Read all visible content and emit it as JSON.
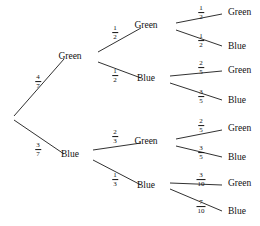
{
  "diagram": {
    "type": "probability-tree",
    "colors": {
      "stroke": "#1a1a1a",
      "text": "#111111",
      "background": "#ffffff"
    },
    "root": {
      "x": 12,
      "y": 118
    },
    "levels": [
      {
        "level": 1,
        "nodes": [
          {
            "id": "g",
            "label": "Green",
            "x": 70,
            "y": 57,
            "branch_label": "4/7",
            "branch_num": "4",
            "branch_den": "7",
            "frac_x": 38,
            "frac_y": 82
          },
          {
            "id": "b",
            "label": "Blue",
            "x": 70,
            "y": 155,
            "branch_label": "3/7",
            "branch_num": "3",
            "branch_den": "7",
            "frac_x": 38,
            "frac_y": 150
          }
        ]
      },
      {
        "level": 2,
        "nodes": [
          {
            "id": "gg",
            "parent": "g",
            "label": "Green",
            "x": 146,
            "y": 26,
            "branch_num": "1",
            "branch_den": "2",
            "frac_x": 115,
            "frac_y": 33
          },
          {
            "id": "gb",
            "parent": "g",
            "label": "Blue",
            "x": 146,
            "y": 79,
            "branch_num": "1",
            "branch_den": "2",
            "frac_x": 115,
            "frac_y": 76
          },
          {
            "id": "bg",
            "parent": "b",
            "label": "Green",
            "x": 146,
            "y": 142,
            "branch_num": "2",
            "branch_den": "3",
            "frac_x": 115,
            "frac_y": 137
          },
          {
            "id": "bb",
            "parent": "b",
            "label": "Blue",
            "x": 146,
            "y": 186,
            "branch_num": "1",
            "branch_den": "3",
            "frac_x": 115,
            "frac_y": 180
          }
        ]
      },
      {
        "level": 3,
        "nodes": [
          {
            "id": "ggg",
            "parent": "gg",
            "label": "Green",
            "x": 228,
            "y": 13,
            "branch_num": "1",
            "branch_den": "2",
            "frac_x": 201,
            "frac_y": 13
          },
          {
            "id": "ggb",
            "parent": "gg",
            "label": "Blue",
            "x": 228,
            "y": 47,
            "branch_num": "1",
            "branch_den": "2",
            "frac_x": 201,
            "frac_y": 41
          },
          {
            "id": "gbg",
            "parent": "gb",
            "label": "Green",
            "x": 228,
            "y": 71,
            "branch_num": "2",
            "branch_den": "5",
            "frac_x": 201,
            "frac_y": 68
          },
          {
            "id": "gbb",
            "parent": "gb",
            "label": "Blue",
            "x": 228,
            "y": 101,
            "branch_num": "3",
            "branch_den": "5",
            "frac_x": 201,
            "frac_y": 97
          },
          {
            "id": "bgg",
            "parent": "bg",
            "label": "Green",
            "x": 228,
            "y": 129,
            "branch_num": "2",
            "branch_den": "5",
            "frac_x": 201,
            "frac_y": 126
          },
          {
            "id": "bgb",
            "parent": "bg",
            "label": "Blue",
            "x": 228,
            "y": 158,
            "branch_num": "3",
            "branch_den": "5",
            "frac_x": 201,
            "frac_y": 153
          },
          {
            "id": "bbg",
            "parent": "bb",
            "label": "Green",
            "x": 228,
            "y": 184,
            "branch_num": "3",
            "branch_den": "10",
            "frac_x": 201,
            "frac_y": 180
          },
          {
            "id": "bbb",
            "parent": "bb",
            "label": "Blue",
            "x": 228,
            "y": 212,
            "branch_num": "7",
            "branch_den": "10",
            "frac_x": 201,
            "frac_y": 207
          }
        ]
      }
    ],
    "edges": [
      {
        "from": "root",
        "to": "g",
        "x1": 14,
        "y1": 116,
        "x2": 64,
        "y2": 59
      },
      {
        "from": "root",
        "to": "b",
        "x1": 14,
        "y1": 120,
        "x2": 64,
        "y2": 154
      },
      {
        "from": "g",
        "to": "gg",
        "x1": 98,
        "y1": 52,
        "x2": 141,
        "y2": 28
      },
      {
        "from": "g",
        "to": "gb",
        "x1": 98,
        "y1": 62,
        "x2": 141,
        "y2": 78
      },
      {
        "from": "b",
        "to": "bg",
        "x1": 93,
        "y1": 150,
        "x2": 141,
        "y2": 143
      },
      {
        "from": "b",
        "to": "bb",
        "x1": 93,
        "y1": 160,
        "x2": 141,
        "y2": 185
      },
      {
        "from": "gg",
        "to": "ggg",
        "x1": 176,
        "y1": 23,
        "x2": 222,
        "y2": 14
      },
      {
        "from": "gg",
        "to": "ggb",
        "x1": 176,
        "y1": 30,
        "x2": 222,
        "y2": 46
      },
      {
        "from": "gb",
        "to": "gbg",
        "x1": 170,
        "y1": 76,
        "x2": 222,
        "y2": 71
      },
      {
        "from": "gb",
        "to": "gbb",
        "x1": 170,
        "y1": 83,
        "x2": 222,
        "y2": 100
      },
      {
        "from": "bg",
        "to": "bgg",
        "x1": 176,
        "y1": 139,
        "x2": 222,
        "y2": 130
      },
      {
        "from": "bg",
        "to": "bgb",
        "x1": 176,
        "y1": 146,
        "x2": 222,
        "y2": 157
      },
      {
        "from": "bb",
        "to": "bbg",
        "x1": 170,
        "y1": 183,
        "x2": 222,
        "y2": 185
      },
      {
        "from": "bb",
        "to": "bbb",
        "x1": 170,
        "y1": 189,
        "x2": 222,
        "y2": 211
      }
    ]
  }
}
